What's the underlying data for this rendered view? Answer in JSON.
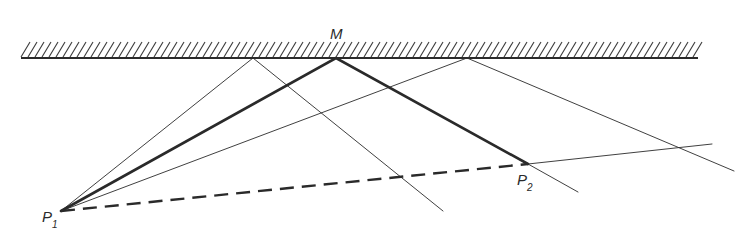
{
  "diagram": {
    "labels": {
      "mirror_point": "M",
      "p1_main": "P",
      "p1_sub": "1",
      "p2_main": "P",
      "p2_sub": "2"
    },
    "mirror": {
      "x1": 21,
      "x2": 698,
      "y": 58,
      "hatch_height": 16,
      "hatch_spacing": 7
    },
    "points": {
      "P1": [
        61,
        211
      ],
      "P2": [
        528,
        164
      ],
      "M": [
        336,
        58
      ],
      "A": [
        253,
        58
      ],
      "B": [
        467,
        58
      ]
    },
    "rays": {
      "main_path": [
        [
          61,
          211
        ],
        [
          336,
          58
        ],
        [
          528,
          164
        ]
      ],
      "direct_dashed": [
        [
          61,
          211
        ],
        [
          528,
          164
        ]
      ],
      "incident_A": [
        [
          61,
          211
        ],
        [
          253,
          58
        ]
      ],
      "reflected_A": [
        [
          253,
          58
        ],
        [
          443,
          211
        ]
      ],
      "incident_B": [
        [
          61,
          211
        ],
        [
          467,
          58
        ]
      ],
      "reflected_B": [
        [
          467,
          58
        ],
        [
          734,
          171
        ]
      ],
      "reflected_M_extension": [
        [
          528,
          164
        ],
        [
          578,
          192
        ]
      ],
      "p2_extension": [
        [
          528,
          164
        ],
        [
          712,
          144
        ]
      ]
    },
    "colors": {
      "ink": "#2a2a2a",
      "background": "#ffffff"
    }
  }
}
